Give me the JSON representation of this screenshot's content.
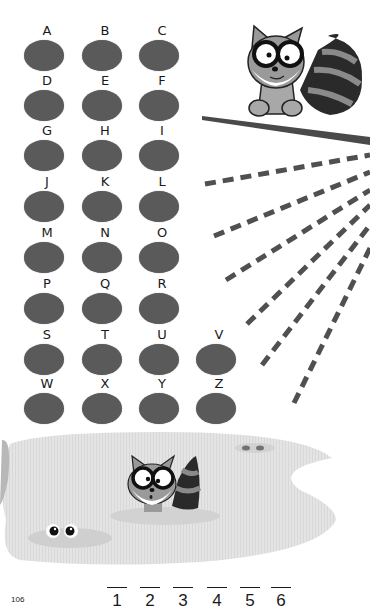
{
  "page": {
    "number": "106"
  },
  "code_grid": {
    "description": "Alphabet letters each above a gray oval",
    "rows": [
      [
        "A",
        "B",
        "C"
      ],
      [
        "D",
        "E",
        "F"
      ],
      [
        "G",
        "H",
        "I"
      ],
      [
        "J",
        "K",
        "L"
      ],
      [
        "M",
        "N",
        "O"
      ],
      [
        "P",
        "Q",
        "R"
      ],
      [
        "S",
        "T",
        "U",
        "V"
      ],
      [
        "W",
        "X",
        "Y",
        "Z"
      ]
    ],
    "oval_color": "#5a5a5a"
  },
  "letters": {
    "A": "A",
    "B": "B",
    "C": "C",
    "D": "D",
    "E": "E",
    "F": "F",
    "G": "G",
    "H": "H",
    "I": "I",
    "J": "J",
    "K": "K",
    "L": "L",
    "M": "M",
    "N": "N",
    "O": "O",
    "P": "P",
    "Q": "Q",
    "R": "R",
    "S": "S",
    "T": "T",
    "U": "U",
    "V": "V",
    "W": "W",
    "X": "X",
    "Y": "Y",
    "Z": "Z"
  },
  "answer_blanks": [
    "1",
    "2",
    "3",
    "4",
    "5",
    "6"
  ],
  "illustration": {
    "top_character": "raccoon-on-branch",
    "bottom_character": "raccoon-in-pond",
    "pond_eyes": 2,
    "dashed_rays": 7
  }
}
